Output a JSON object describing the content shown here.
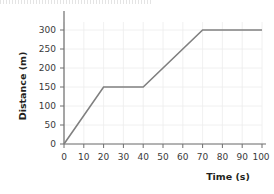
{
  "chart_data": {
    "type": "line",
    "title": "",
    "xlabel": "Time (s)",
    "ylabel": "Distance (m)",
    "xlim": [
      0,
      100
    ],
    "ylim": [
      0,
      300
    ],
    "xticks": [
      0,
      10,
      20,
      30,
      40,
      50,
      60,
      70,
      80,
      90,
      100
    ],
    "yticks": [
      0,
      50,
      100,
      150,
      200,
      250,
      300
    ],
    "xticklabels": [
      "0",
      "10",
      "20",
      "30",
      "40",
      "50",
      "60",
      "70",
      "80",
      "90",
      "100"
    ],
    "yticklabels": [
      "0",
      "50",
      "100",
      "150",
      "200",
      "250",
      "300"
    ],
    "grid": true,
    "legend": null,
    "series": [
      {
        "name": "distance",
        "color": "#808080",
        "x": [
          0,
          20,
          40,
          70,
          100
        ],
        "y": [
          0,
          150,
          150,
          300,
          300
        ]
      }
    ],
    "annotations": []
  },
  "figure": {
    "background_color": "#ffffff",
    "axis_color": "#6e6e6e",
    "grid_color": "#ececec",
    "tick_label_color": "#3a3a3a",
    "axis_label_color": "#231f20"
  }
}
